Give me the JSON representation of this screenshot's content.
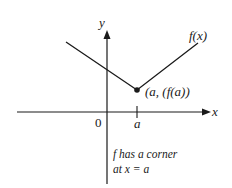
{
  "diagram": {
    "axes": {
      "x_label": "x",
      "y_label": "y",
      "origin_label": "0",
      "tick_label": "a"
    },
    "function_label": "f(x)",
    "point_label": "(a, (f(a))",
    "note_line1": "f has a corner",
    "note_line2": "at x = a",
    "colors": {
      "stroke": "#1a1a1a",
      "background": "#ffffff"
    }
  }
}
